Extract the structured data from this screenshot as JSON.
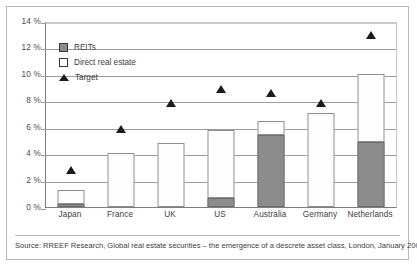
{
  "chart_data": {
    "type": "bar",
    "title": "",
    "subtitle": "",
    "xlabel": "",
    "ylabel": "",
    "ylim": [
      0,
      14
    ],
    "ytick_values": [
      0,
      2,
      4,
      6,
      8,
      10,
      12,
      14
    ],
    "ytick_labels": [
      "0 %",
      "2 %",
      "4 %",
      "6 %",
      "8 %",
      "10 %",
      "12 %",
      "14 %"
    ],
    "grid": true,
    "grid_axis": "y",
    "stacked": true,
    "legend_position": "upper-left-inside",
    "categories": [
      "Japan",
      "France",
      "UK",
      "US",
      "Australia",
      "Germany",
      "Netherlands"
    ],
    "series": [
      {
        "name": "REITs",
        "type": "bar-segment",
        "color": "#8c8c8c",
        "values": [
          0.25,
          0.0,
          0.0,
          0.7,
          5.45,
          0.0,
          4.9
        ]
      },
      {
        "name": "Direct real estate",
        "type": "bar-segment",
        "color": "#ffffff",
        "values": [
          1.0,
          4.1,
          4.85,
          5.1,
          1.05,
          7.05,
          5.15
        ]
      },
      {
        "name": "Target",
        "type": "marker",
        "marker": "triangle",
        "color": "#1b1b1b",
        "values": [
          2.9,
          6.0,
          7.95,
          9.0,
          8.75,
          7.95,
          13.1
        ]
      }
    ],
    "totals": [
      1.25,
      4.1,
      4.85,
      5.8,
      6.5,
      7.05,
      10.05
    ]
  },
  "legend": {
    "items": [
      {
        "label": "REITs",
        "icon": "filled-square-swatch"
      },
      {
        "label": "Direct real estate",
        "icon": "outline-square-swatch"
      },
      {
        "label": "Target",
        "icon": "triangle-marker"
      }
    ]
  },
  "source": {
    "text": "Source: RREEF Research, Global real estate securities – the emergence of a descrete asset class, London, January 2007, p. 19"
  },
  "colors": {
    "reits_fill": "#8c8c8c",
    "direct_fill": "#ffffff",
    "bar_stroke": "#8f8f8f",
    "target_marker": "#1b1b1b",
    "gridline": "#9b9b9b",
    "axis": "#7d7d7d",
    "frame": "#b9b9b9",
    "text": "#3d3d3d"
  }
}
